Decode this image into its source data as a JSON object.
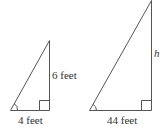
{
  "diagram": {
    "small_triangle": {
      "base_label": "4 feet",
      "height_label": "6 feet"
    },
    "large_triangle": {
      "base_label": "44 feet",
      "height_label": "h"
    },
    "colors": {
      "stroke": "#555555",
      "text": "#333333"
    }
  }
}
